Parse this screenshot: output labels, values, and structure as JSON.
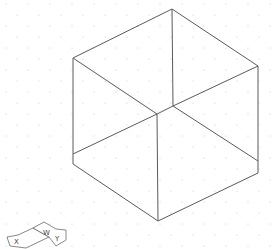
{
  "viewport": {
    "type": "3d-model-space",
    "background_color": "#ffffff",
    "grid": "dot-grid",
    "line_color": "#5a5a5a"
  },
  "object": {
    "type": "cube",
    "view": "isometric",
    "render": "wireframe"
  },
  "ucs_icon": {
    "x_label": "X",
    "y_label": "Y",
    "w_label": "W",
    "icon": "ucs-icon"
  }
}
